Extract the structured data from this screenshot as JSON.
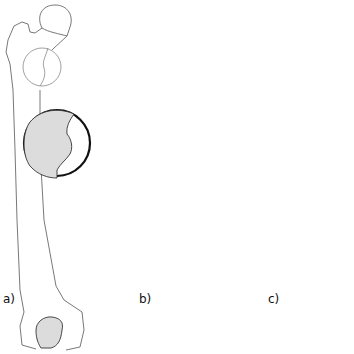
{
  "figure": {
    "colors": {
      "background": "#ffffff",
      "bone_outline": "#555555",
      "inset_border": "#111111",
      "shaded_region": "#dcdcdc"
    },
    "panels": [
      {
        "id": "a",
        "label": "a)",
        "fracture": false,
        "shaded_side": "left"
      },
      {
        "id": "b",
        "label": "b)",
        "fracture": true,
        "shaded_side": "right"
      },
      {
        "id": "c",
        "label": "c)",
        "fracture": true,
        "shaded_side": "right-narrow"
      }
    ]
  }
}
